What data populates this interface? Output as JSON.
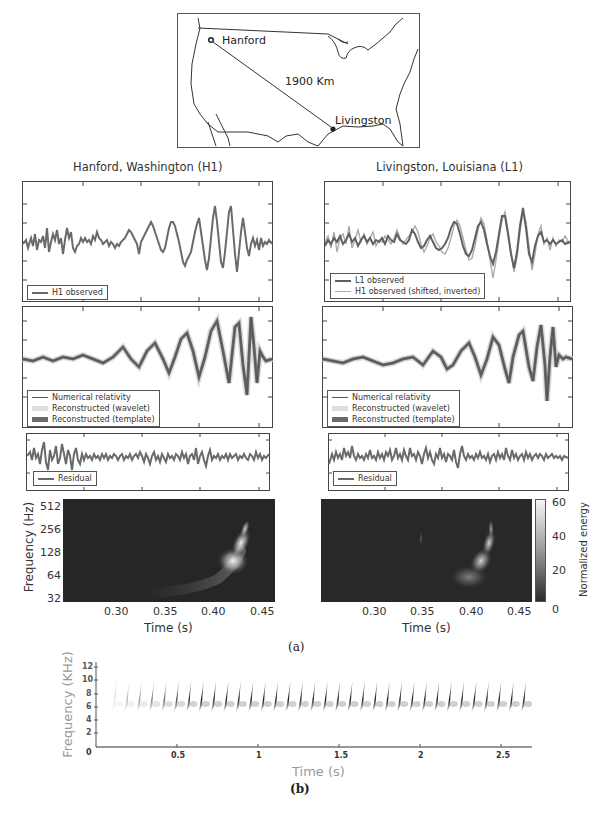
{
  "map": {
    "site_a": "Hanford",
    "site_b": "Livingston",
    "distance": "1900 Km"
  },
  "left_title": "Hanford, Washington (H1)",
  "right_title": "Livingston, Louisiana (L1)",
  "legends": {
    "h1_observed": "H1 observed",
    "l1_observed": "L1 observed",
    "h1_shifted": "H1 observed (shifted, inverted)",
    "numerical_relativity": "Numerical relativity",
    "reconstructed_wavelet": "Reconstructed (wavelet)",
    "reconstructed_template": "Reconstructed (template)",
    "residual": "Residual"
  },
  "spectrogram": {
    "ylabel": "Frequency (Hz)",
    "xlabel": "Time (s)",
    "yticks": [
      "512",
      "256",
      "128",
      "64",
      "32"
    ],
    "xticks": [
      "0.30",
      "0.35",
      "0.40",
      "0.45"
    ],
    "colorbar_label": "Normalized energy",
    "colorbar_ticks": [
      "60",
      "40",
      "20",
      "0"
    ]
  },
  "caption_a": "(a)",
  "caption_b": "(b)",
  "bird": {
    "ylabel": "Frequency (KHz)",
    "xlabel": "Time (s)",
    "yticks": [
      "12",
      "10",
      "8",
      "6",
      "4",
      "2",
      "0"
    ],
    "xticks": [
      "0.5",
      "1",
      "1.5",
      "2",
      "2.5"
    ]
  },
  "chart_data": [
    {
      "type": "line",
      "title": "Hanford, Washington (H1)",
      "panel": "strain observed",
      "series": [
        {
          "name": "H1 observed"
        }
      ],
      "xlim": [
        0.25,
        0.46
      ],
      "xlabel": "Time (s)",
      "note": "noisy strain with chirp growing to peak near 0.41-0.43 s"
    },
    {
      "type": "line",
      "title": "Livingston, Louisiana (L1)",
      "panel": "strain observed",
      "series": [
        {
          "name": "L1 observed"
        },
        {
          "name": "H1 observed (shifted, inverted)"
        }
      ],
      "xlim": [
        0.25,
        0.46
      ]
    },
    {
      "type": "line",
      "panel": "reconstruction H1",
      "series": [
        {
          "name": "Numerical relativity"
        },
        {
          "name": "Reconstructed (wavelet)"
        },
        {
          "name": "Reconstructed (template)"
        }
      ],
      "xlim": [
        0.25,
        0.46
      ]
    },
    {
      "type": "line",
      "panel": "reconstruction L1",
      "series": [
        {
          "name": "Numerical relativity"
        },
        {
          "name": "Reconstructed (wavelet)"
        },
        {
          "name": "Reconstructed (template)"
        }
      ],
      "xlim": [
        0.25,
        0.46
      ]
    },
    {
      "type": "line",
      "panel": "residual H1",
      "series": [
        {
          "name": "Residual"
        }
      ]
    },
    {
      "type": "line",
      "panel": "residual L1",
      "series": [
        {
          "name": "Residual"
        }
      ]
    },
    {
      "type": "heatmap",
      "panel": "spectrogram H1",
      "xlabel": "Time (s)",
      "ylabel": "Frequency (Hz)",
      "xticks": [
        0.3,
        0.35,
        0.4,
        0.45
      ],
      "yticks": [
        32,
        64,
        128,
        256,
        512
      ],
      "xlim": [
        0.25,
        0.46
      ],
      "ylim": [
        24,
        600
      ],
      "note": "chirp track rising from ~35 Hz at 0.33 s to ~300 Hz at 0.43 s"
    },
    {
      "type": "heatmap",
      "panel": "spectrogram L1",
      "xlabel": "Time (s)",
      "xticks": [
        0.3,
        0.35,
        0.4,
        0.45
      ],
      "colorbar": {
        "label": "Normalized energy",
        "range": [
          0,
          60
        ],
        "ticks": [
          0,
          20,
          40,
          60
        ]
      },
      "note": "chirp track rising to ~300 Hz near 0.42 s"
    },
    {
      "type": "heatmap",
      "panel": "(b) bird song spectrogram",
      "xlabel": "Time (s)",
      "ylabel": "Frequency (KHz)",
      "xticks": [
        0.5,
        1,
        1.5,
        2,
        2.5
      ],
      "yticks": [
        0,
        2,
        4,
        6,
        8,
        10,
        12
      ],
      "xlim": [
        0,
        2.7
      ],
      "ylim": [
        0,
        13
      ],
      "note": "~34 repeated down-sweeping syllables from ~0.1 s to 2.7 s, spanning ~4-8 kHz"
    }
  ]
}
